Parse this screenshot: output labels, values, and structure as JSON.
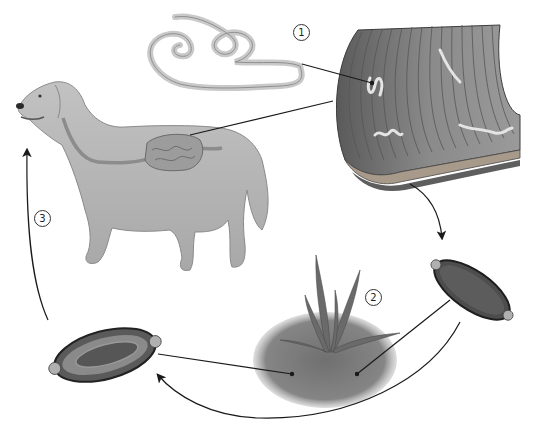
{
  "diagram": {
    "steps": [
      {
        "number": "1",
        "description": "Adult worms in intestinal wall"
      },
      {
        "number": "2",
        "description": "Eggs in soil / environment"
      },
      {
        "number": "3",
        "description": "Embryonated egg ingested by dog"
      }
    ],
    "components": {
      "host": "dog-with-digestive-tract",
      "adult_worm": "coiled-adult-worm",
      "intestine": "intestinal-wall-section",
      "egg_unembryonated": "unembryonated-egg",
      "egg_embryonated": "embryonated-egg",
      "environment": "soil-with-grass"
    },
    "colors": {
      "background": "#ffffff",
      "line": "#1a1a1a",
      "dog": "#b8b8b8",
      "worm": "#c4c4c4",
      "intestine": "#7a7a7a",
      "egg": "#4a4a4a",
      "soil": "#6e6e6e"
    }
  }
}
